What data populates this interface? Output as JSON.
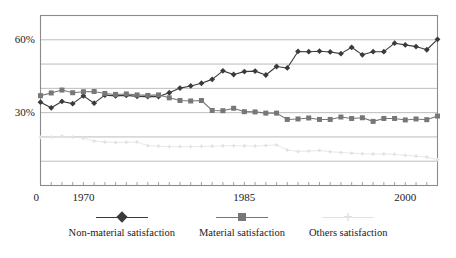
{
  "chart_data": {
    "type": "line",
    "title": "",
    "xlabel": "",
    "ylabel": "",
    "xlim": [
      1966,
      2003
    ],
    "ylim": [
      0,
      70
    ],
    "grid": true,
    "gridlines_y": [
      10,
      20,
      30,
      40,
      50,
      60
    ],
    "y_ticklabels": [
      {
        "value": 60,
        "label": "60%"
      },
      {
        "value": 30,
        "label": "30%"
      }
    ],
    "x_ticklabels": [
      {
        "value": 1965.6,
        "label": "0"
      },
      {
        "value": 1970,
        "label": "1970"
      },
      {
        "value": 1985,
        "label": "1985"
      },
      {
        "value": 2000,
        "label": "2000"
      }
    ],
    "legend_position": "bottom",
    "x": [
      1966,
      1967,
      1968,
      1969,
      1970,
      1971,
      1972,
      1973,
      1974,
      1975,
      1976,
      1977,
      1978,
      1979,
      1980,
      1981,
      1982,
      1983,
      1984,
      1985,
      1986,
      1987,
      1988,
      1989,
      1990,
      1991,
      1992,
      1993,
      1994,
      1995,
      1996,
      1997,
      1998,
      1999,
      2000,
      2001,
      2002,
      2003
    ],
    "series": [
      {
        "name": "Non-material satisfaction",
        "marker": "diamond",
        "color": "#3a3a3a",
        "values": [
          34.3,
          32.0,
          34.6,
          33.7,
          36.9,
          33.9,
          37.2,
          36.9,
          37.1,
          36.7,
          36.6,
          36.6,
          38.2,
          40.1,
          41.0,
          42.1,
          43.7,
          47.2,
          45.7,
          46.9,
          47.1,
          45.5,
          49.0,
          48.4,
          55.2,
          55.1,
          55.3,
          55.0,
          54.3,
          56.9,
          53.8,
          55.1,
          55.1,
          58.6,
          57.9,
          57.2,
          55.9,
          60.2
        ]
      },
      {
        "name": "Material satisfaction",
        "marker": "square",
        "color": "#777777",
        "values": [
          37.0,
          38.1,
          39.3,
          38.2,
          38.6,
          38.7,
          37.9,
          37.5,
          37.7,
          37.3,
          37.1,
          37.3,
          36.1,
          35.0,
          34.8,
          35.0,
          30.9,
          30.8,
          31.8,
          30.4,
          30.3,
          29.8,
          29.8,
          27.2,
          27.4,
          27.8,
          27.2,
          27.2,
          28.2,
          27.6,
          27.9,
          26.4,
          27.6,
          27.6,
          27.0,
          27.4,
          27.1,
          28.6
        ]
      },
      {
        "name": "Others satisfaction",
        "marker": "star",
        "color": "#e2e2e2",
        "values": [
          19.8,
          20.0,
          20.3,
          20.0,
          19.5,
          18.3,
          17.9,
          17.7,
          17.8,
          17.9,
          16.4,
          16.2,
          16.0,
          16.0,
          16.0,
          16.1,
          16.2,
          16.3,
          16.4,
          16.3,
          16.2,
          16.5,
          16.7,
          14.6,
          14.0,
          14.2,
          14.4,
          13.9,
          13.6,
          13.3,
          13.1,
          12.9,
          13.0,
          12.8,
          12.4,
          12.1,
          11.7,
          10.6
        ]
      }
    ]
  },
  "legend": {
    "items": [
      {
        "label": "Non-material satisfaction"
      },
      {
        "label": "Material satisfaction"
      },
      {
        "label": "Others satisfaction"
      }
    ]
  },
  "colors": {
    "series_non_material": "#3a3a3a",
    "series_material": "#777777",
    "series_others": "#e2e2e2",
    "grid": "#b4b4b4",
    "frame": "#8a8a8a",
    "background": "#ffffff"
  }
}
